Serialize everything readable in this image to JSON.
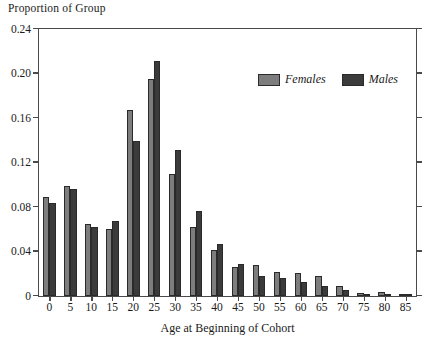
{
  "chart_data": {
    "type": "bar",
    "title": "",
    "ylabel": "Proportion of Group",
    "xlabel": "Age at Beginning of Cohort",
    "categories": [
      "0",
      "5",
      "10",
      "15",
      "20",
      "25",
      "30",
      "35",
      "40",
      "45",
      "50",
      "55",
      "60",
      "65",
      "70",
      "75",
      "80",
      "85"
    ],
    "series": [
      {
        "name": "Females",
        "color": "#7d7d7d",
        "values": [
          0.089,
          0.099,
          0.065,
          0.06,
          0.167,
          0.195,
          0.11,
          0.062,
          0.041,
          0.026,
          0.028,
          0.022,
          0.021,
          0.018,
          0.009,
          0.003,
          0.004,
          0.002
        ]
      },
      {
        "name": "Males",
        "color": "#3b3b3b",
        "values": [
          0.084,
          0.096,
          0.062,
          0.067,
          0.139,
          0.211,
          0.131,
          0.076,
          0.047,
          0.029,
          0.018,
          0.016,
          0.013,
          0.009,
          0.005,
          0.002,
          0.001,
          0.001
        ]
      }
    ],
    "ylim": [
      0,
      0.24
    ],
    "yticks": [
      0,
      0.04,
      0.08,
      0.12,
      0.16,
      0.2,
      0.24
    ],
    "ytick_labels": [
      "0",
      "0.04",
      "0.08",
      "0.12",
      "0.16",
      "0.20",
      "0.24"
    ],
    "grid": false,
    "legend_position": "upper right",
    "legend_entries": [
      "Females",
      "Males"
    ]
  }
}
